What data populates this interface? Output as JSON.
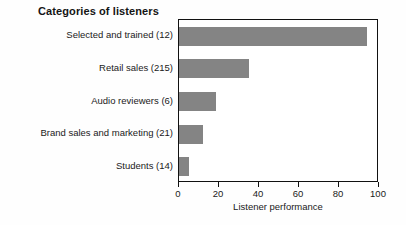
{
  "chart_data": {
    "type": "bar",
    "orientation": "horizontal",
    "title": "Categories of listeners",
    "xlabel": "Listener performance",
    "ylabel": "",
    "categories": [
      "Selected and trained (12)",
      "Retail sales (215)",
      "Audio reviewers (6)",
      "Brand sales and marketing (21)",
      "Students (14)"
    ],
    "values": [
      94,
      35,
      18.5,
      12,
      5
    ],
    "xlim": [
      0,
      100
    ],
    "xticks": [
      0,
      20,
      40,
      60,
      80,
      100
    ],
    "xtick_labels": [
      "0",
      "20",
      "40",
      "60",
      "80",
      "100"
    ],
    "grid": false,
    "legend": false,
    "bar_color": "#848484",
    "frame_color": "#111111",
    "background": "#ffffff"
  }
}
